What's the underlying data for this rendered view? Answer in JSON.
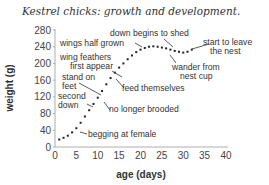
{
  "chart_data": {
    "type": "scatter",
    "title": "Kestrel chicks: growth and development.",
    "xlabel": "age (days)",
    "ylabel": "weight (g)",
    "xlim": [
      0,
      40
    ],
    "ylim": [
      0,
      280
    ],
    "xticks": [
      0,
      5,
      10,
      15,
      20,
      25,
      30,
      35,
      40
    ],
    "yticks": [
      0,
      40,
      80,
      120,
      160,
      200,
      240,
      280
    ],
    "grid": false,
    "series": [
      {
        "name": "weight",
        "x": [
          1,
          2,
          3,
          4,
          5,
          6,
          7,
          8,
          9,
          10,
          11,
          12,
          13,
          14,
          15,
          16,
          17,
          18,
          19,
          20,
          21,
          22,
          23,
          24,
          25,
          26,
          27,
          28,
          29,
          30,
          31,
          32
        ],
        "values": [
          18,
          22,
          27,
          35,
          45,
          58,
          73,
          88,
          103,
          118,
          134,
          150,
          165,
          178,
          190,
          200,
          210,
          219,
          227,
          233,
          237,
          240,
          241,
          240,
          238,
          236,
          233,
          230,
          228,
          226,
          228,
          233
        ]
      }
    ],
    "annotations": [
      {
        "text": "down begins to shed",
        "x": 24,
        "y": 240
      },
      {
        "text": "wings half grown",
        "x": 20,
        "y": 232
      },
      {
        "text": "start to leave the nest",
        "x": 31,
        "y": 230
      },
      {
        "text": "wing feathers first appear",
        "x": 13,
        "y": 165
      },
      {
        "text": "wander from nest cup",
        "x": 24,
        "y": 238
      },
      {
        "text": "stand on feet",
        "x": 11,
        "y": 130
      },
      {
        "text": "feed themselves",
        "x": 14,
        "y": 172
      },
      {
        "text": "second down",
        "x": 9,
        "y": 108
      },
      {
        "text": "no longer brooded",
        "x": 11,
        "y": 125
      },
      {
        "text": "begging at female",
        "x": 6,
        "y": 58
      }
    ]
  },
  "labels": {
    "title": "Kestrel chicks: growth and development.",
    "xlabel": "age (days)",
    "ylabel": "weight (g)",
    "xticks": [
      "0",
      "5",
      "10",
      "15",
      "20",
      "25",
      "30",
      "35",
      "40"
    ],
    "yticks": [
      "0",
      "40",
      "80",
      "120",
      "160",
      "200",
      "240",
      "280"
    ],
    "anno": {
      "down_shed": "down begins to shed",
      "wings_half": "wings half grown",
      "leave_1": "start to leave",
      "leave_2": "the nest",
      "wing_feathers_1": "wing feathers",
      "wing_feathers_2": "first appear",
      "wander_1": "wander from",
      "wander_2": "nest cup",
      "stand_1": "stand on",
      "stand_2": "feet",
      "feed": "feed themselves",
      "second_1": "second",
      "second_2": "down",
      "brooded": "no longer brooded",
      "begging": "begging at female"
    }
  }
}
